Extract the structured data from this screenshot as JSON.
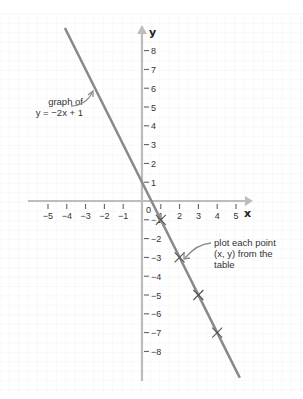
{
  "chart_data": {
    "type": "line",
    "title": "",
    "xlabel": "x",
    "ylabel": "y",
    "xlim": [
      -5.8,
      5.9
    ],
    "ylim": [
      -9.3,
      9.3
    ],
    "grid": true,
    "x_ticks": [
      -5,
      -4,
      -3,
      -2,
      -1,
      1,
      2,
      3,
      4,
      5
    ],
    "y_ticks": [
      8,
      7,
      6,
      5,
      4,
      3,
      2,
      1,
      -1,
      -2,
      -3,
      -4,
      -5,
      -6,
      -7,
      -8
    ],
    "origin_label": "0",
    "series": [
      {
        "name": "y = -2x + 1",
        "equation": "y = -2x + 1",
        "line_segment": {
          "x": [
            -4.1,
            5.2
          ],
          "y": [
            9.2,
            -9.4
          ]
        },
        "marked_points": [
          {
            "x": 1,
            "y": -1
          },
          {
            "x": 2,
            "y": -3
          },
          {
            "x": 3,
            "y": -5
          },
          {
            "x": 4,
            "y": -7
          }
        ],
        "color": "#8a8a8a"
      }
    ],
    "annotations": [
      {
        "lines": [
          "graph of",
          "y = −2x + 1"
        ],
        "points_to": {
          "x": -2.3,
          "y": 5.8
        }
      },
      {
        "lines": [
          "plot each point",
          "(x, y) from the",
          "table"
        ],
        "points_to": {
          "x": 2,
          "y": -3
        }
      }
    ]
  },
  "labels": {
    "x_axis": "x",
    "y_axis": "y",
    "origin": "0",
    "annotation_graph_line1": "graph of",
    "annotation_graph_line2": "y = −2x + 1",
    "annotation_points_line1": "plot each point",
    "annotation_points_line2": "(x, y) from the",
    "annotation_points_line3": "table"
  },
  "colors": {
    "axis": "#bdbdbd",
    "line": "#8a8a8a",
    "grid": "#f4f4f4",
    "text": "#333333"
  }
}
